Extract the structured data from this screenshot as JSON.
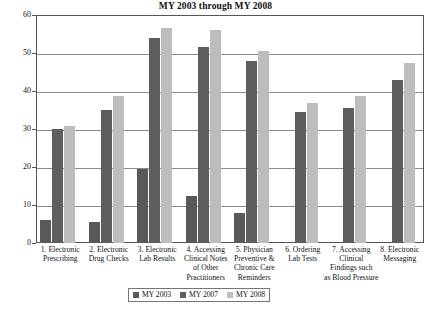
{
  "chart_data": {
    "type": "bar",
    "title": "MY 2003 through MY 2008",
    "xlabel": "",
    "ylabel": "Percent of POs",
    "ylim": [
      0,
      60
    ],
    "ytick_step": 10,
    "yticks": [
      "0",
      "10",
      "20",
      "30",
      "40",
      "50",
      "60"
    ],
    "grid": true,
    "legend_position": "bottom-center",
    "categories": [
      "1. Electronic Prescribing",
      "2. Electronic Drug Checks",
      "3. Electronic Lab Results",
      "4. Accessing Clinical Notes of Other Practitioners",
      "5. Physician Preventive & Chronic Care Reminders",
      "6. Ordering Lab Tests",
      "7. Accessing Clinical Findings such as Blood Pressure",
      "8. Electronic Messaging"
    ],
    "category_lines": [
      [
        "1. Electronic",
        "Prescribing"
      ],
      [
        "2. Electronic",
        "Drug Checks"
      ],
      [
        "3. Electronic",
        "Lab Results"
      ],
      [
        "4. Accessing",
        "Clinical Notes",
        "of Other",
        "Practitioners"
      ],
      [
        "5. Physician",
        "Preventive &",
        "Chronic Care",
        "Reminders"
      ],
      [
        "6. Ordering",
        "Lab Tests"
      ],
      [
        "7. Accessing",
        "Clinical",
        "Findings such",
        "as Blood Pressure"
      ],
      [
        "8. Electronic",
        "Messaging"
      ]
    ],
    "series": [
      {
        "name": "MY 2003",
        "color": "#595959",
        "values": [
          6,
          5.5,
          19.5,
          12.5,
          8,
          null,
          null,
          null
        ]
      },
      {
        "name": "MY 2007",
        "color": "#5e5e5e",
        "values": [
          30,
          35,
          54,
          51.5,
          48,
          34.5,
          35.5,
          43
        ]
      },
      {
        "name": "MY 2008",
        "color": "#bdbdbd",
        "values": [
          30.8,
          38.8,
          56.5,
          56,
          50.5,
          36.8,
          38.8,
          47.5
        ]
      }
    ]
  },
  "legend": {
    "items": [
      {
        "label": "MY 2003",
        "color": "#595959"
      },
      {
        "label": "MY 2007",
        "color": "#5e5e5e"
      },
      {
        "label": "MY 2008",
        "color": "#bdbdbd"
      }
    ]
  },
  "footnote": {
    "text": ""
  }
}
